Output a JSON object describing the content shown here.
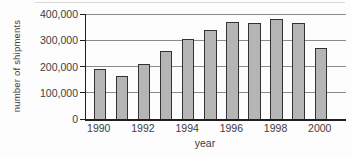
{
  "chart_data": {
    "type": "bar",
    "categories": [
      "1990",
      "1991",
      "1992",
      "1993",
      "1994",
      "1995",
      "1996",
      "1997",
      "1998",
      "1999",
      "2000"
    ],
    "values": [
      190000,
      165000,
      210000,
      260000,
      305000,
      340000,
      370000,
      365000,
      380000,
      365000,
      270000
    ],
    "title": "",
    "xlabel": "year",
    "ylabel": "number of shipments",
    "ylim": [
      0,
      400000
    ],
    "yticks": [
      0,
      100000,
      200000,
      300000,
      400000
    ],
    "ytick_labels": [
      "0",
      "100,000",
      "200,000",
      "300,000",
      "400,000"
    ],
    "xtick_labels": [
      "1990",
      "1992",
      "1994",
      "1996",
      "1998",
      "2000"
    ],
    "xtick_bar_indices": [
      0,
      2,
      4,
      6,
      8,
      10
    ],
    "grid": true,
    "legend_position": "none",
    "colors": {
      "bar_fill": "#b5b5b5",
      "bar_border": "#333333",
      "gridline": "#8a8a8a",
      "axis": "#1f1f1f",
      "text": "#3c3c3c",
      "background": "#fdfdfd",
      "frame_hairline": "#d9d9d9"
    }
  }
}
